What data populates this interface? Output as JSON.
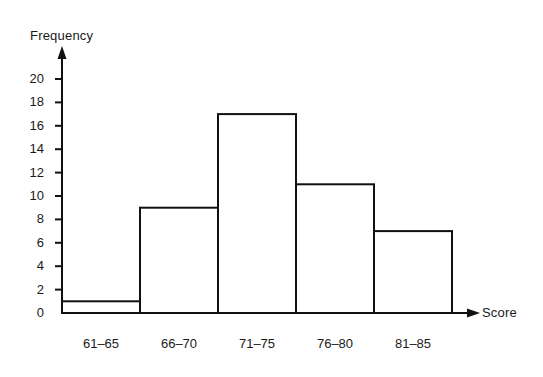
{
  "chart_data": {
    "type": "bar",
    "title": "",
    "subtitle": "",
    "xlabel": "Score",
    "ylabel": "Frequency",
    "categories": [
      "61–65",
      "66–70",
      "71–75",
      "76–80",
      "81–85"
    ],
    "values": [
      1,
      9,
      17,
      11,
      7
    ],
    "ylim": [
      0,
      20
    ],
    "y_ticks": [
      0,
      2,
      4,
      6,
      8,
      10,
      12,
      14,
      16,
      18,
      20
    ],
    "y_tick_labels": [
      "0",
      "2",
      "4",
      "6",
      "8",
      "10",
      "12",
      "14",
      "16",
      "18",
      "20"
    ],
    "grid": false,
    "legend": null,
    "bar_fill": "none",
    "bar_stroke": "#111111",
    "axis_color": "#111111",
    "background": "#ffffff",
    "annotations": []
  },
  "axes": {
    "y_title": "Frequency",
    "x_title": "Score"
  }
}
